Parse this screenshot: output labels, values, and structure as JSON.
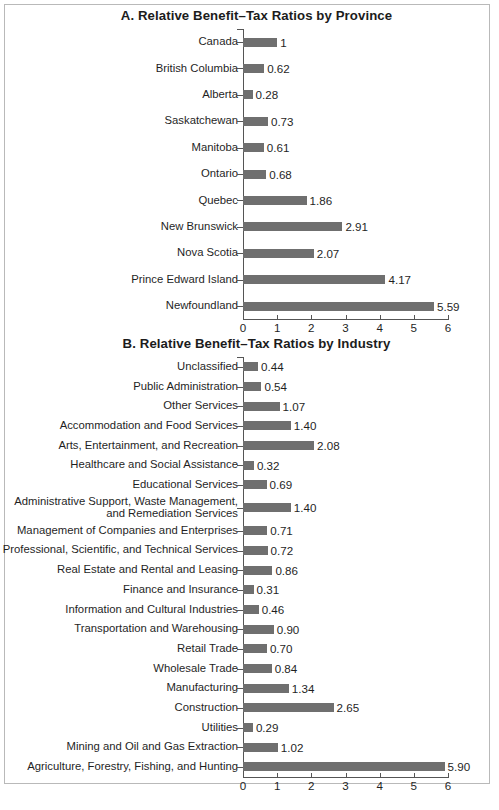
{
  "page": {
    "width": 499,
    "height": 810,
    "bar_color": "#6f6f6f",
    "axis_color": "#555555",
    "text_color": "#1f1f1f"
  },
  "chart_data": [
    {
      "id": "panel-a",
      "type": "bar",
      "orientation": "horizontal",
      "title": "A.  Relative Benefit–Tax Ratios by Province",
      "xlabel": "",
      "ylabel": "",
      "xlim": [
        0,
        6
      ],
      "xticks": [
        0,
        1,
        2,
        3,
        4,
        5,
        6
      ],
      "xtick_labels": [
        "0",
        "1",
        "2",
        "3",
        "4",
        "5",
        "6"
      ],
      "grid": false,
      "legend": "none",
      "categories": [
        "Canada",
        "British Columbia",
        "Alberta",
        "Saskatchewan",
        "Manitoba",
        "Ontario",
        "Quebec",
        "New Brunswick",
        "Nova Scotia",
        "Prince Edward Island",
        "Newfoundland"
      ],
      "values": [
        1,
        0.62,
        0.28,
        0.73,
        0.61,
        0.68,
        1.86,
        2.91,
        2.07,
        4.17,
        5.59
      ],
      "value_labels": [
        "1",
        "0.62",
        "0.28",
        "0.73",
        "0.61",
        "0.68",
        "1.86",
        "2.91",
        "2.07",
        "4.17",
        "5.59"
      ]
    },
    {
      "id": "panel-b",
      "type": "bar",
      "orientation": "horizontal",
      "title": "B.  Relative Benefit–Tax Ratios by Industry",
      "xlabel": "",
      "ylabel": "",
      "xlim": [
        0,
        6
      ],
      "xticks": [
        0,
        1,
        2,
        3,
        4,
        5,
        6
      ],
      "xtick_labels": [
        "0",
        "1",
        "2",
        "3",
        "4",
        "5",
        "6"
      ],
      "grid": false,
      "legend": "none",
      "categories": [
        "Unclassified",
        "Public Administration",
        "Other Services",
        "Accommodation and Food Services",
        "Arts, Entertainment, and Recreation",
        "Healthcare and Social Assistance",
        "Educational Services",
        "Administrative Support, Waste Management,\nand Remediation Services",
        "Management of Companies and Enterprises",
        "Professional, Scientific, and Technical Services",
        "Real Estate and Rental and Leasing",
        "Finance and Insurance",
        "Information and Cultural Industries",
        "Transportation and Warehousing",
        "Retail Trade",
        "Wholesale Trade",
        "Manufacturing",
        "Construction",
        "Utilities",
        "Mining and Oil and Gas Extraction",
        "Agriculture, Forestry, Fishing, and Hunting"
      ],
      "values": [
        0.44,
        0.54,
        1.07,
        1.4,
        2.08,
        0.32,
        0.69,
        1.4,
        0.71,
        0.72,
        0.86,
        0.31,
        0.46,
        0.9,
        0.7,
        0.84,
        1.34,
        2.65,
        0.29,
        1.02,
        5.9
      ],
      "value_labels": [
        "0.44",
        "0.54",
        "1.07",
        "1.40",
        "2.08",
        "0.32",
        "0.69",
        "1.40",
        "0.71",
        "0.72",
        "0.86",
        "0.31",
        "0.46",
        "0.90",
        "0.70",
        "0.84",
        "1.34",
        "2.65",
        "0.29",
        "1.02",
        "5.90"
      ]
    }
  ]
}
